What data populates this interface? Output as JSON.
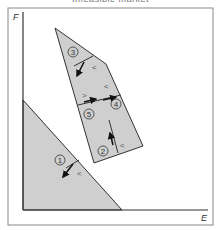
{
  "caption": "Infeasible market",
  "axes": {
    "x_label": "E",
    "y_label": "F"
  },
  "colors": {
    "region_fill": "#cfcfcf",
    "stroke": "#333333",
    "frame": "#888888"
  },
  "regions": [
    {
      "id": "1",
      "label": "1",
      "inequality": "<"
    },
    {
      "id": "2",
      "label": "2",
      "inequality": "<"
    },
    {
      "id": "3",
      "label": "3",
      "inequality": "<"
    },
    {
      "id": "4",
      "label": "4",
      "inequality": "<"
    },
    {
      "id": "5",
      "label": "5",
      "inequality": ">"
    }
  ]
}
